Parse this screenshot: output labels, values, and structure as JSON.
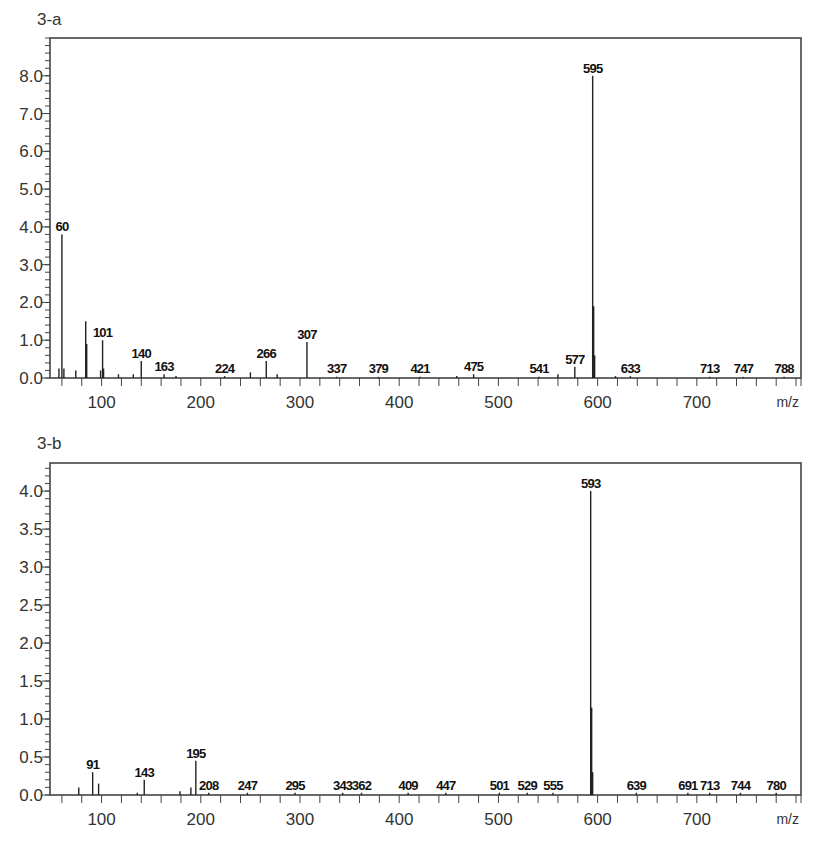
{
  "chart_data": [
    {
      "type": "bar",
      "subtype": "mass-spectrum-stick",
      "title": "3-a",
      "xlabel": "m/z",
      "ylabel": "",
      "xlim": [
        48,
        805
      ],
      "ylim": [
        0,
        9.0
      ],
      "x_ticks": [
        100,
        200,
        300,
        400,
        500,
        600,
        700
      ],
      "x_minor_step": 20,
      "y_ticks": [
        0.0,
        1.0,
        2.0,
        3.0,
        4.0,
        5.0,
        6.0,
        7.0,
        8.0
      ],
      "y_tick_labels": [
        "0.0",
        "1.0",
        "2.0",
        "3.0",
        "4.0",
        "5.0",
        "6.0",
        "7.0",
        "8.0"
      ],
      "y_minor_step": 0.2,
      "grid": false,
      "peaks": [
        {
          "x": 57,
          "y": 0.25,
          "label": ""
        },
        {
          "x": 60,
          "y": 3.8,
          "label": "60"
        },
        {
          "x": 62,
          "y": 0.25,
          "label": ""
        },
        {
          "x": 74,
          "y": 0.2,
          "label": ""
        },
        {
          "x": 84,
          "y": 1.5,
          "label": ""
        },
        {
          "x": 85,
          "y": 0.9,
          "label": ""
        },
        {
          "x": 99,
          "y": 0.2,
          "label": ""
        },
        {
          "x": 101,
          "y": 1.0,
          "label": "101"
        },
        {
          "x": 102,
          "y": 0.25,
          "label": ""
        },
        {
          "x": 117,
          "y": 0.1,
          "label": ""
        },
        {
          "x": 132,
          "y": 0.1,
          "label": ""
        },
        {
          "x": 140,
          "y": 0.45,
          "label": "140"
        },
        {
          "x": 163,
          "y": 0.1,
          "label": "163"
        },
        {
          "x": 175,
          "y": 0.05,
          "label": ""
        },
        {
          "x": 224,
          "y": 0.05,
          "label": "224"
        },
        {
          "x": 250,
          "y": 0.15,
          "label": ""
        },
        {
          "x": 266,
          "y": 0.45,
          "label": "266"
        },
        {
          "x": 277,
          "y": 0.1,
          "label": ""
        },
        {
          "x": 307,
          "y": 0.95,
          "label": "307"
        },
        {
          "x": 337,
          "y": 0.03,
          "label": "337"
        },
        {
          "x": 379,
          "y": 0.03,
          "label": "379"
        },
        {
          "x": 421,
          "y": 0.03,
          "label": "421"
        },
        {
          "x": 458,
          "y": 0.05,
          "label": ""
        },
        {
          "x": 475,
          "y": 0.1,
          "label": "475"
        },
        {
          "x": 541,
          "y": 0.03,
          "label": "541"
        },
        {
          "x": 560,
          "y": 0.1,
          "label": ""
        },
        {
          "x": 577,
          "y": 0.3,
          "label": "577"
        },
        {
          "x": 595,
          "y": 8.0,
          "label": "595"
        },
        {
          "x": 596,
          "y": 1.9,
          "label": ""
        },
        {
          "x": 597,
          "y": 0.6,
          "label": ""
        },
        {
          "x": 618,
          "y": 0.05,
          "label": ""
        },
        {
          "x": 633,
          "y": 0.05,
          "label": "633"
        },
        {
          "x": 713,
          "y": 0.03,
          "label": "713"
        },
        {
          "x": 747,
          "y": 0.03,
          "label": "747"
        },
        {
          "x": 788,
          "y": 0.03,
          "label": "788"
        }
      ]
    },
    {
      "type": "bar",
      "subtype": "mass-spectrum-stick",
      "title": "3-b",
      "xlabel": "m/z",
      "ylabel": "",
      "xlim": [
        48,
        805
      ],
      "ylim": [
        0,
        4.37
      ],
      "x_ticks": [
        100,
        200,
        300,
        400,
        500,
        600,
        700
      ],
      "x_minor_step": 20,
      "y_ticks": [
        0.0,
        0.5,
        1.0,
        1.5,
        2.0,
        2.5,
        3.0,
        3.5,
        4.0
      ],
      "y_tick_labels": [
        "0.0",
        "0.5",
        "1.0",
        "1.5",
        "2.0",
        "2.5",
        "3.0",
        "3.5",
        "4.0"
      ],
      "y_minor_step": 0.1,
      "grid": false,
      "peaks": [
        {
          "x": 77,
          "y": 0.1,
          "label": ""
        },
        {
          "x": 91,
          "y": 0.3,
          "label": "91"
        },
        {
          "x": 97,
          "y": 0.15,
          "label": ""
        },
        {
          "x": 136,
          "y": 0.03,
          "label": ""
        },
        {
          "x": 143,
          "y": 0.2,
          "label": "143"
        },
        {
          "x": 179,
          "y": 0.05,
          "label": ""
        },
        {
          "x": 190,
          "y": 0.1,
          "label": ""
        },
        {
          "x": 195,
          "y": 0.45,
          "label": "195"
        },
        {
          "x": 208,
          "y": 0.03,
          "label": "208"
        },
        {
          "x": 247,
          "y": 0.03,
          "label": "247"
        },
        {
          "x": 295,
          "y": 0.03,
          "label": "295"
        },
        {
          "x": 343,
          "y": 0.03,
          "label": "343"
        },
        {
          "x": 362,
          "y": 0.03,
          "label": "362"
        },
        {
          "x": 409,
          "y": 0.03,
          "label": "409"
        },
        {
          "x": 447,
          "y": 0.03,
          "label": "447"
        },
        {
          "x": 501,
          "y": 0.03,
          "label": "501"
        },
        {
          "x": 529,
          "y": 0.03,
          "label": "529"
        },
        {
          "x": 555,
          "y": 0.03,
          "label": "555"
        },
        {
          "x": 593,
          "y": 4.0,
          "label": "593"
        },
        {
          "x": 594,
          "y": 1.15,
          "label": ""
        },
        {
          "x": 595,
          "y": 0.3,
          "label": ""
        },
        {
          "x": 639,
          "y": 0.03,
          "label": "639"
        },
        {
          "x": 691,
          "y": 0.03,
          "label": "691"
        },
        {
          "x": 713,
          "y": 0.03,
          "label": "713"
        },
        {
          "x": 744,
          "y": 0.03,
          "label": "744"
        },
        {
          "x": 780,
          "y": 0.03,
          "label": "780"
        }
      ]
    }
  ],
  "panels": [
    {
      "title": "3-a",
      "unit": "m/z"
    },
    {
      "title": "3-b",
      "unit": "m/z"
    }
  ]
}
